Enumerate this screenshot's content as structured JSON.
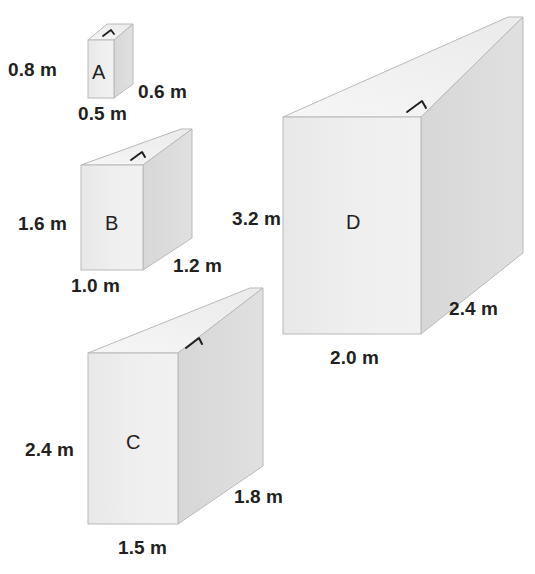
{
  "figure": {
    "unit": "m",
    "colors": {
      "front_face": "#eeeeee",
      "side_face": "#d9d9d9",
      "top_face": "#f4f4f4",
      "outline": "#b5b5b5",
      "text": "#231f20",
      "right_angle_marker": "#231f20",
      "background": "#ffffff"
    }
  },
  "prisms": [
    {
      "id": "A",
      "letter": "A",
      "height_label": "0.8 m",
      "width_label": "0.5 m",
      "depth_label": "0.6 m",
      "height_value": 0.8,
      "width_value": 0.5,
      "depth_value": 0.6
    },
    {
      "id": "B",
      "letter": "B",
      "height_label": "1.6 m",
      "width_label": "1.0 m",
      "depth_label": "1.2 m",
      "height_value": 1.6,
      "width_value": 1.0,
      "depth_value": 1.2
    },
    {
      "id": "C",
      "letter": "C",
      "height_label": "2.4 m",
      "width_label": "1.5 m",
      "depth_label": "1.8 m",
      "height_value": 2.4,
      "width_value": 1.5,
      "depth_value": 1.8
    },
    {
      "id": "D",
      "letter": "D",
      "height_label": "3.2 m",
      "width_label": "2.0 m",
      "depth_label": "2.4 m",
      "height_value": 3.2,
      "width_value": 2.0,
      "depth_value": 2.4
    }
  ],
  "labels": {
    "a_height": "0.8 m",
    "a_width": "0.5 m",
    "a_depth": "0.6 m",
    "a_letter": "A",
    "b_height": "1.6 m",
    "b_width": "1.0 m",
    "b_depth": "1.2 m",
    "b_letter": "B",
    "c_height": "2.4 m",
    "c_width": "1.5 m",
    "c_depth": "1.8 m",
    "c_letter": "C",
    "d_height": "3.2 m",
    "d_width": "2.0 m",
    "d_depth": "2.4 m",
    "d_letter": "D"
  }
}
